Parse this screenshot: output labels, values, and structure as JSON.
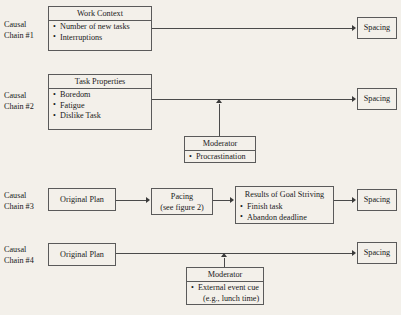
{
  "figure": {
    "background_color": "#f3f0ea",
    "line_color": "#5a5a5a"
  },
  "chains": {
    "chain1": {
      "label_line1": "Causal",
      "label_line2": "Chain #1",
      "source_box": {
        "title": "Work Context",
        "items": [
          "Number of new tasks",
          "Interruptions"
        ]
      },
      "outcome_box": {
        "title": "Spacing"
      }
    },
    "chain2": {
      "label_line1": "Causal",
      "label_line2": "Chain #2",
      "source_box": {
        "title": "Task Properties",
        "items": [
          "Boredom",
          "Fatigue",
          "Dislike Task"
        ]
      },
      "moderator_box": {
        "title": "Moderator",
        "items": [
          "Procrastination"
        ]
      },
      "outcome_box": {
        "title": "Spacing"
      }
    },
    "chain3": {
      "label_line1": "Causal",
      "label_line2": "Chain #3",
      "source_box": {
        "title": "Original Plan"
      },
      "middle_box": {
        "line1": "Pacing",
        "line2": "(see figure 2)"
      },
      "results_box": {
        "title": "Results of Goal Striving",
        "items": [
          "Finish task",
          "Abandon deadline"
        ]
      },
      "outcome_box": {
        "title": "Spacing"
      }
    },
    "chain4": {
      "label_line1": "Causal",
      "label_line2": "Chain #4",
      "source_box": {
        "title": "Original Plan"
      },
      "moderator_box": {
        "title": "Moderator",
        "item_line1": "External event cue",
        "item_line2": "(e.g., lunch time)"
      },
      "outcome_box": {
        "title": "Spacing"
      }
    }
  }
}
